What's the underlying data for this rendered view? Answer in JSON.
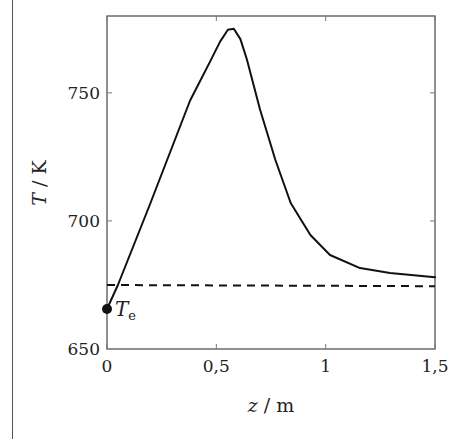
{
  "chart_data": {
    "type": "line",
    "title": "",
    "xlabel": "z / m",
    "ylabel": "T / K",
    "xlim": [
      0,
      1.5
    ],
    "ylim": [
      650,
      780
    ],
    "x_ticks": [
      0,
      0.5,
      1,
      1.5
    ],
    "x_tick_labels": [
      "0",
      "0,5",
      "1",
      "1,5"
    ],
    "y_ticks": [
      650,
      700,
      750
    ],
    "y_tick_labels": [
      "650",
      "700",
      "750"
    ],
    "grid": false,
    "legend": null,
    "series": [
      {
        "name": "T(z)",
        "style": "solid",
        "color": "#111111",
        "x": [
          0,
          0.05,
          0.197,
          0.38,
          0.47,
          0.517,
          0.553,
          0.58,
          0.61,
          0.64,
          0.7,
          0.77,
          0.84,
          0.93,
          1.02,
          1.157,
          1.294,
          1.5
        ],
        "y": [
          665.6,
          675,
          706.6,
          747,
          762,
          770,
          774.6,
          775,
          771,
          763,
          743.4,
          723.8,
          707,
          694.5,
          686.7,
          681.6,
          679.7,
          678
        ]
      },
      {
        "name": "reference",
        "style": "dashed",
        "color": "#111111",
        "x": [
          0,
          1.5
        ],
        "y": [
          675,
          674.5
        ]
      }
    ],
    "annotations": [
      {
        "type": "point",
        "x": 0,
        "y": 665.6,
        "label": "T",
        "subscript": "e"
      }
    ]
  }
}
